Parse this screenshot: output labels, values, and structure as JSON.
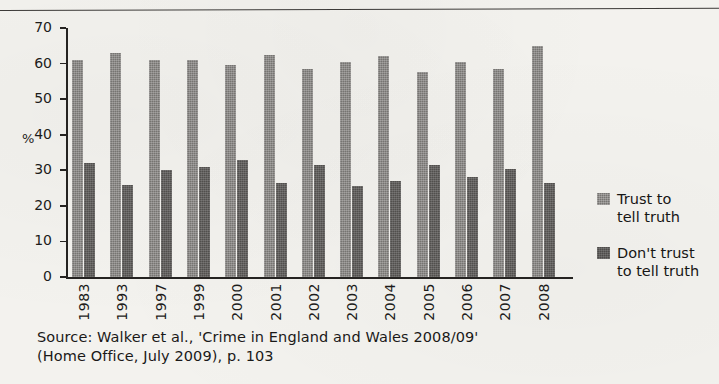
{
  "chart_data": {
    "type": "bar",
    "title": "",
    "subtitle": "",
    "xlabel": "",
    "ylabel": "%",
    "ylim": [
      0,
      70
    ],
    "yticks": [
      0,
      10,
      20,
      30,
      40,
      50,
      60,
      70
    ],
    "grid": false,
    "legend_position": "right",
    "categories": [
      "1983",
      "1993",
      "1997",
      "1999",
      "2000",
      "2001",
      "2002",
      "2003",
      "2004",
      "2005",
      "2006",
      "2007",
      "2008"
    ],
    "series": [
      {
        "name": "Trust to tell truth",
        "color": "#767471",
        "values": [
          61,
          63,
          61,
          61,
          59.5,
          62.5,
          58.5,
          60.5,
          62,
          57.5,
          60.5,
          58.5,
          65
        ]
      },
      {
        "name": "Don't trust to tell truth",
        "color": "#514f4d",
        "values": [
          32,
          26,
          30,
          31,
          33,
          26.5,
          31.5,
          25.5,
          27,
          31.5,
          28,
          30.5,
          26.5
        ]
      }
    ]
  },
  "legend": {
    "entries": [
      {
        "line1": "Trust to",
        "line2": "tell truth"
      },
      {
        "line1": "Don't trust",
        "line2": "to tell truth"
      }
    ]
  },
  "source": {
    "line1": "Source: Walker et al., 'Crime in England and Wales 2008/09'",
    "line2": "(Home Office, July 2009), p. 103"
  }
}
